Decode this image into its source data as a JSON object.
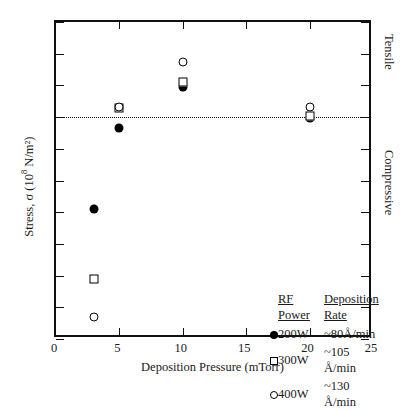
{
  "chart_data": {
    "type": "scatter",
    "title": "",
    "xlabel": "Deposition Pressure (mTorr)",
    "ylabel_html": "Stress, σ (10⁸ N/m²)",
    "ylabel_prefix": "Stress, σ (10",
    "ylabel_exponent": "8",
    "ylabel_suffix": " N/m²)",
    "xlim": [
      0,
      25
    ],
    "ylim": [
      -14,
      6
    ],
    "xticks": [
      0,
      5,
      10,
      15,
      20,
      25
    ],
    "xtick_labels": [
      "0",
      "5",
      "10",
      "15",
      "20",
      "25"
    ],
    "yticks": [
      6,
      4,
      2,
      0,
      -2,
      -4,
      -6,
      -8,
      -10,
      -12,
      -14
    ],
    "ytick_labels": [
      "6",
      "4",
      "2",
      "0",
      "2",
      "4",
      "6",
      "8",
      "10",
      "12",
      "14"
    ],
    "grid": false,
    "zero_line": {
      "value": 0,
      "style": "dotted",
      "label": "zero-stress-line"
    },
    "region_labels": [
      {
        "text": "Tensile",
        "position": "above-zero-right"
      },
      {
        "text": "Compressive",
        "position": "below-zero-right"
      }
    ],
    "series": [
      {
        "name": "200W",
        "marker": "filled-circle",
        "deposition_rate": "~80Å/min",
        "points": [
          {
            "x": 3,
            "y": -5.8
          },
          {
            "x": 5,
            "y": -0.7
          },
          {
            "x": 10,
            "y": 1.9
          },
          {
            "x": 20,
            "y": -0.05
          }
        ]
      },
      {
        "name": "300W",
        "marker": "open-square",
        "deposition_rate": "~105 Å/min",
        "points": [
          {
            "x": 3,
            "y": -10.2
          },
          {
            "x": 5,
            "y": 0.6
          },
          {
            "x": 10,
            "y": 2.2
          },
          {
            "x": 20,
            "y": 0.05
          }
        ]
      },
      {
        "name": "400W",
        "marker": "open-circle",
        "deposition_rate": "~130 Å/min",
        "points": [
          {
            "x": 3,
            "y": -12.6
          },
          {
            "x": 5,
            "y": 0.65
          },
          {
            "x": 10,
            "y": 3.5
          },
          {
            "x": 20,
            "y": 0.65
          }
        ]
      }
    ],
    "legend": {
      "position": "inside-lower-right",
      "headers": [
        "RF Power",
        "Deposition Rate"
      ],
      "rows": [
        {
          "marker": "filled-circle",
          "power": "200W",
          "rate": "~80Å/min"
        },
        {
          "marker": "open-square",
          "power": "300W",
          "rate": "~105 Å/min"
        },
        {
          "marker": "open-circle",
          "power": "400W",
          "rate": "~130 Å/min"
        }
      ]
    }
  }
}
